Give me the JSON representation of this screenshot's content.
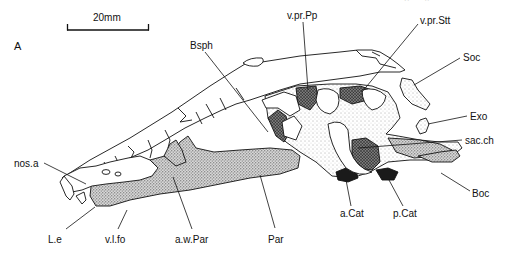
{
  "figure": {
    "panel_label": "A",
    "running_header_fragment": "... p ... y ...",
    "scale_bar": {
      "label": "20mm",
      "x1": 67,
      "x2": 149,
      "y": 28
    },
    "colors": {
      "ink": "#111111",
      "stipple_dark": "#3a3a3a",
      "stipple_mid": "#8a8a8a",
      "stipple_light": "#c8c8c8",
      "background": "#ffffff"
    },
    "labels": [
      {
        "id": "Bsph",
        "text": "Bsph",
        "x": 190,
        "y": 40
      },
      {
        "id": "v.pr.Pp",
        "text": "v.pr.Pp",
        "x": 287,
        "y": 10
      },
      {
        "id": "v.pr.Stt",
        "text": "v.pr.Stt",
        "x": 420,
        "y": 15
      },
      {
        "id": "Soc",
        "text": "Soc",
        "x": 463,
        "y": 52
      },
      {
        "id": "Exo",
        "text": "Exo",
        "x": 470,
        "y": 111
      },
      {
        "id": "sac.ch",
        "text": "sac.ch",
        "x": 465,
        "y": 135
      },
      {
        "id": "nos.a",
        "text": "nos.a",
        "x": 14,
        "y": 158
      },
      {
        "id": "Boc",
        "text": "Boc",
        "x": 472,
        "y": 188
      },
      {
        "id": "a.Cat",
        "text": "a.Cat",
        "x": 340,
        "y": 208
      },
      {
        "id": "p.Cat",
        "text": "p.Cat",
        "x": 393,
        "y": 208
      },
      {
        "id": "L.e",
        "text": "L.e",
        "x": 48,
        "y": 234
      },
      {
        "id": "v.l.fo",
        "text": "v.l.fo",
        "x": 105,
        "y": 234
      },
      {
        "id": "a.w.Par",
        "text": "a.w.Par",
        "x": 175,
        "y": 234
      },
      {
        "id": "Par",
        "text": "Par",
        "x": 268,
        "y": 234
      }
    ],
    "leader_lines": [
      {
        "label": "Bsph",
        "x1": 205,
        "y1": 52,
        "x2": 268,
        "y2": 132
      },
      {
        "label": "v.pr.Pp",
        "x1": 303,
        "y1": 22,
        "x2": 308,
        "y2": 90
      },
      {
        "label": "v.pr.Stt",
        "x1": 418,
        "y1": 24,
        "x2": 362,
        "y2": 92
      },
      {
        "label": "Soc",
        "x1": 460,
        "y1": 58,
        "x2": 414,
        "y2": 85
      },
      {
        "label": "Exo",
        "x1": 467,
        "y1": 116,
        "x2": 428,
        "y2": 124
      },
      {
        "label": "sac.ch",
        "x1": 462,
        "y1": 140,
        "x2": 358,
        "y2": 148
      },
      {
        "label": "nos.a",
        "x1": 44,
        "y1": 163,
        "x2": 86,
        "y2": 184
      },
      {
        "label": "Boc",
        "x1": 470,
        "y1": 191,
        "x2": 441,
        "y2": 173
      },
      {
        "label": "a.Cat",
        "x1": 351,
        "y1": 206,
        "x2": 346,
        "y2": 180
      },
      {
        "label": "p.Cat",
        "x1": 403,
        "y1": 206,
        "x2": 389,
        "y2": 180
      },
      {
        "label": "L.e",
        "x1": 66,
        "y1": 229,
        "x2": 95,
        "y2": 207
      },
      {
        "label": "v.l.fo",
        "x1": 118,
        "y1": 229,
        "x2": 127,
        "y2": 210
      },
      {
        "label": "a.w.Par",
        "x1": 192,
        "y1": 229,
        "x2": 173,
        "y2": 177
      },
      {
        "label": "Par",
        "x1": 275,
        "y1": 228,
        "x2": 260,
        "y2": 175
      }
    ]
  }
}
